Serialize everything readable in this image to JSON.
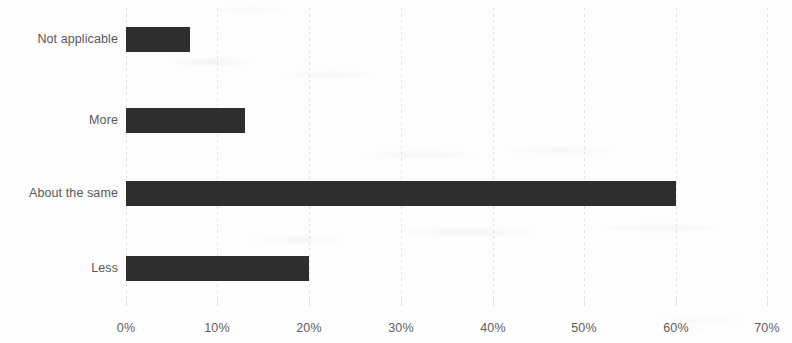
{
  "chart_data": {
    "type": "bar",
    "orientation": "horizontal",
    "title": "",
    "subtitle": "",
    "xlabel": "",
    "ylabel": "",
    "categories": [
      "Not applicable",
      "More",
      "About the same",
      "Less"
    ],
    "values": [
      7,
      13,
      60,
      20
    ],
    "value_suffix": "%",
    "xlim": [
      0,
      70
    ],
    "xticks": [
      0,
      10,
      20,
      30,
      40,
      50,
      60,
      70
    ],
    "xtick_labels": [
      "0%",
      "10%",
      "20%",
      "30%",
      "40%",
      "50%",
      "60%",
      "70%"
    ],
    "grid": true,
    "grid_axis": "x",
    "legend": false,
    "legend_position": "none",
    "data_labels": false,
    "series": [
      {
        "name": "",
        "values": [
          7,
          13,
          60,
          20
        ]
      }
    ]
  },
  "style": {
    "bar_color": "#2e2e2e",
    "background_color": "#fdfdfd",
    "gridline_color": "#e4e4e4",
    "axis_color": "#dcdcdc",
    "label_color": "#58585a",
    "tick_label_color": "#5d5d5f"
  }
}
